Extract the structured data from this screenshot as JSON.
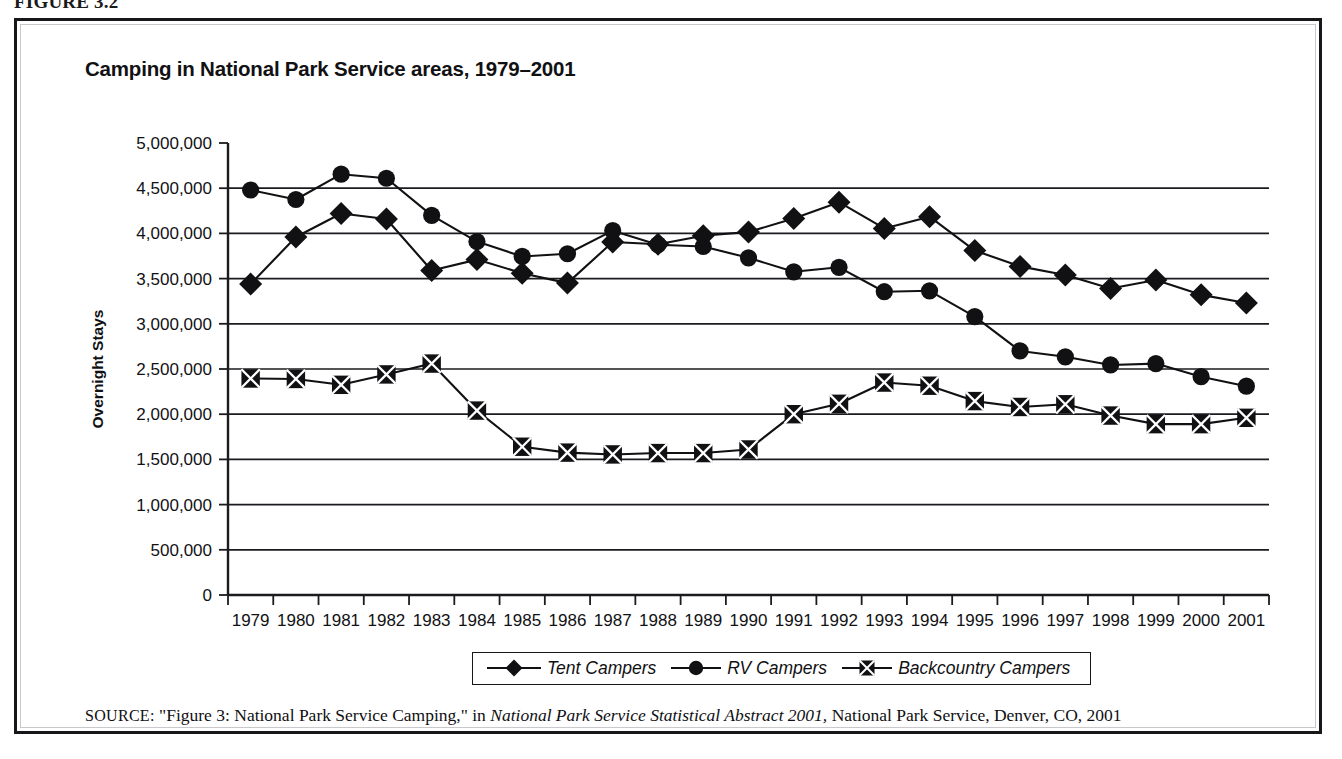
{
  "figure": {
    "caption": "FIGURE 3.2",
    "source_kicker": "SOURCE:",
    "source_text_1": " \"Figure 3: National Park Service Camping,\" in ",
    "source_italic": "National Park Service Statistical Abstract 2001,",
    "source_text_2": " National Park Service, Denver, CO, 2001"
  },
  "chart_data": {
    "type": "line",
    "title": "Camping in National Park Service areas, 1979–2001",
    "xlabel": "",
    "ylabel": "Overnight Stays",
    "ylim": [
      0,
      5000000
    ],
    "xlim": [
      1979,
      2001
    ],
    "grid": true,
    "legend_position": "bottom",
    "ytick_labels": [
      "5,000,000",
      "4,500,000",
      "4,000,000",
      "3,500,000",
      "3,000,000",
      "2,500,000",
      "2,000,000",
      "1,500,000",
      "1,000,000",
      "500,000",
      "0"
    ],
    "ytick_values": [
      5000000,
      4500000,
      4000000,
      3500000,
      3000000,
      2500000,
      2000000,
      1500000,
      1000000,
      500000,
      0
    ],
    "categories": [
      "1979",
      "1980",
      "1981",
      "1982",
      "1983",
      "1984",
      "1985",
      "1986",
      "1987",
      "1988",
      "1989",
      "1990",
      "1991",
      "1992",
      "1993",
      "1994",
      "1995",
      "1996",
      "1997",
      "1998",
      "1999",
      "2000",
      "2001"
    ],
    "series": [
      {
        "name": "Tent Campers",
        "marker": "diamond",
        "color": "#111114",
        "values": [
          3440000,
          3960000,
          4220000,
          4160000,
          3590000,
          3710000,
          3560000,
          3450000,
          3905000,
          3880000,
          3975000,
          4015000,
          4165000,
          4345000,
          4055000,
          4185000,
          3810000,
          3635000,
          3540000,
          3390000,
          3485000,
          3320000,
          3230000
        ]
      },
      {
        "name": "RV Campers",
        "marker": "circle",
        "color": "#111114",
        "values": [
          4480000,
          4375000,
          4655000,
          4610000,
          4200000,
          3910000,
          3745000,
          3775000,
          4030000,
          3875000,
          3855000,
          3730000,
          3575000,
          3625000,
          3355000,
          3365000,
          3080000,
          2700000,
          2635000,
          2545000,
          2560000,
          2415000,
          2310000
        ]
      },
      {
        "name": "Backcountry Campers",
        "marker": "crossed-square",
        "color": "#111114",
        "values": [
          2395000,
          2390000,
          2325000,
          2440000,
          2560000,
          2040000,
          1640000,
          1575000,
          1555000,
          1570000,
          1570000,
          1610000,
          2000000,
          2115000,
          2350000,
          2315000,
          2145000,
          2080000,
          2110000,
          1985000,
          1890000,
          1890000,
          1960000
        ]
      }
    ]
  },
  "legend": {
    "entries": [
      {
        "label": "Tent Campers",
        "icon": "diamond-marker-icon"
      },
      {
        "label": "RV Campers",
        "icon": "circle-marker-icon"
      },
      {
        "label": "Backcountry Campers",
        "icon": "crossed-square-marker-icon"
      }
    ]
  }
}
